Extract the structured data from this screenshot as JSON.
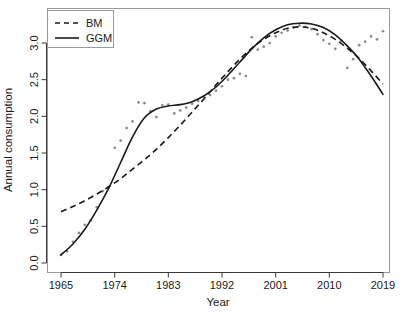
{
  "chart_data": {
    "type": "scatter",
    "title": "",
    "xlabel": "Year",
    "ylabel": "Annual consumption",
    "xlim": [
      1965,
      2019
    ],
    "ylim": [
      0.0,
      3.3
    ],
    "grid": false,
    "legend_position": "top-left",
    "x_ticks": [
      1965,
      1974,
      1983,
      1992,
      2001,
      2010,
      2019
    ],
    "x_tick_labels": [
      "1965",
      "1974",
      "1983",
      "1992",
      "2001",
      "2010",
      "2019"
    ],
    "y_ticks": [
      0.0,
      0.5,
      1.0,
      1.5,
      2.0,
      2.5,
      3.0
    ],
    "y_tick_labels": [
      "0.0",
      "0.5",
      "1.0",
      "1.5",
      "2.0",
      "2.5",
      "3.0"
    ],
    "point_color": "#8c8c8c",
    "line_color": "#1a1a1a",
    "observed": {
      "name": "Observed data",
      "x": [
        1965,
        1966,
        1967,
        1968,
        1969,
        1970,
        1971,
        1972,
        1973,
        1974,
        1975,
        1976,
        1977,
        1978,
        1979,
        1980,
        1981,
        1982,
        1983,
        1984,
        1985,
        1986,
        1987,
        1988,
        1989,
        1990,
        1991,
        1992,
        1993,
        1994,
        1995,
        1996,
        1997,
        1998,
        1999,
        2000,
        2001,
        2002,
        2003,
        2004,
        2005,
        2006,
        2007,
        2008,
        2009,
        2010,
        2011,
        2012,
        2013,
        2014,
        2015,
        2016,
        2017,
        2018,
        2019
      ],
      "y": [
        0.11,
        0.16,
        0.29,
        0.41,
        0.52,
        0.58,
        0.76,
        0.98,
        1.03,
        1.57,
        1.67,
        1.84,
        1.93,
        2.19,
        2.18,
        2.07,
        1.99,
        2.15,
        2.16,
        2.04,
        2.08,
        2.12,
        2.17,
        2.21,
        2.26,
        2.29,
        2.35,
        2.41,
        2.5,
        2.52,
        2.58,
        2.55,
        3.08,
        2.91,
        2.95,
        3.0,
        3.09,
        3.14,
        3.17,
        3.21,
        3.24,
        3.22,
        3.19,
        3.12,
        3.04,
        2.99,
        2.92,
        3.03,
        2.66,
        2.78,
        2.97,
        3.02,
        3.09,
        3.05,
        3.16
      ]
    },
    "series": [
      {
        "name": "BM",
        "style": "dashed",
        "x": [
          1965,
          1967,
          1969,
          1971,
          1973,
          1975,
          1977,
          1979,
          1981,
          1983,
          1985,
          1987,
          1989,
          1991,
          1993,
          1995,
          1997,
          1999,
          2001,
          2003,
          2005,
          2007,
          2009,
          2011,
          2013,
          2015,
          2017,
          2019
        ],
        "y": [
          0.7,
          0.77,
          0.85,
          0.94,
          1.04,
          1.15,
          1.28,
          1.41,
          1.55,
          1.71,
          1.88,
          2.06,
          2.24,
          2.43,
          2.61,
          2.78,
          2.93,
          3.05,
          3.14,
          3.2,
          3.22,
          3.2,
          3.14,
          3.05,
          2.93,
          2.79,
          2.62,
          2.44
        ]
      },
      {
        "name": "GGM",
        "style": "solid",
        "x": [
          1965,
          1967,
          1969,
          1971,
          1973,
          1975,
          1977,
          1979,
          1981,
          1983,
          1985,
          1987,
          1989,
          1991,
          1993,
          1995,
          1997,
          1999,
          2001,
          2003,
          2005,
          2007,
          2009,
          2011,
          2013,
          2015,
          2017,
          2019
        ],
        "y": [
          0.11,
          0.26,
          0.46,
          0.72,
          1.02,
          1.37,
          1.72,
          1.98,
          2.1,
          2.14,
          2.16,
          2.2,
          2.28,
          2.4,
          2.56,
          2.74,
          2.92,
          3.07,
          3.18,
          3.25,
          3.27,
          3.26,
          3.21,
          3.11,
          2.96,
          2.78,
          2.55,
          2.3
        ]
      }
    ]
  },
  "legend": {
    "entries": [
      {
        "label": "BM",
        "style": "dashed"
      },
      {
        "label": "GGM",
        "style": "solid"
      }
    ]
  },
  "axes": {
    "x_title": "Year",
    "y_title": "Annual consumption"
  }
}
